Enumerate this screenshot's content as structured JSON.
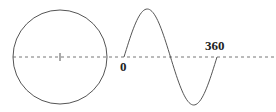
{
  "diagram": {
    "colors": {
      "stroke": "#555555",
      "dashed_axis": "#777777",
      "label": "#222222",
      "background": "#ffffff"
    },
    "circle": {
      "cx": 60,
      "cy": 57,
      "r": 47
    },
    "axis": {
      "y": 57,
      "x_start": 13,
      "x_end": 276,
      "dash": "3,3"
    },
    "center_tick": {
      "x": 60,
      "y1": 53,
      "y2": 61
    },
    "sine_wave": {
      "x_start": 124,
      "x_end": 217,
      "baseline_y": 57,
      "amplitude": 48,
      "cycles": 1
    },
    "labels": {
      "start": "0",
      "end": "360"
    }
  }
}
